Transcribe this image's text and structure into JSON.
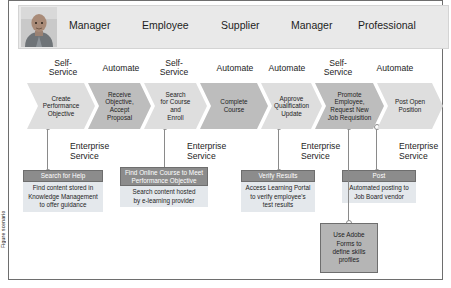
{
  "caption_strip": "Figure scenario",
  "header": {
    "avatar_name": "user-photo",
    "roles": [
      {
        "label": "Manager",
        "left": 60
      },
      {
        "label": "Employee",
        "left": 133
      },
      {
        "label": "Supplier",
        "left": 212
      },
      {
        "label": "Manager",
        "left": 282
      },
      {
        "label": "Professional",
        "left": 349
      }
    ]
  },
  "modes": [
    {
      "label": "Self-\nService",
      "left": 28,
      "top": 58,
      "width": 52
    },
    {
      "label": "Automate",
      "left": 86,
      "top": 63,
      "width": 52
    },
    {
      "label": "Self-\nService",
      "left": 139,
      "top": 58,
      "width": 52
    },
    {
      "label": "Automate",
      "left": 200,
      "top": 63,
      "width": 52
    },
    {
      "label": "Automate",
      "left": 252,
      "top": 63,
      "width": 52
    },
    {
      "label": "Self-\nService",
      "left": 303,
      "top": 58,
      "width": 52
    },
    {
      "label": "Automate",
      "left": 360,
      "top": 63,
      "width": 52
    }
  ],
  "steps": [
    {
      "label": "Create\nPerformance\nObjective",
      "left": 18,
      "width": 68,
      "shade": "light"
    },
    {
      "label": "Receive\nObjective,\nAccept\nProposal",
      "left": 79,
      "width": 63,
      "shade": "dark"
    },
    {
      "label": "Search\nfor Course\nand\nEnroll",
      "left": 135,
      "width": 63,
      "shade": "light"
    },
    {
      "label": "Complete\nCourse",
      "left": 191,
      "width": 68,
      "shade": "dark"
    },
    {
      "label": "Approve\nQualification\nUpdate",
      "left": 252,
      "width": 61,
      "shade": "light"
    },
    {
      "label": "Promote\nEmployee,\nRequest New\nJob Requisition",
      "left": 306,
      "width": 69,
      "shade": "dark"
    },
    {
      "label": "Post Open\nPosition",
      "left": 368,
      "width": 66,
      "shade": "light"
    }
  ],
  "services": [
    {
      "es_label": "Enterprise\nService",
      "es_left": 61,
      "es_top": 141,
      "dot_x": 38,
      "line_top": 126,
      "line_bottom": 171,
      "title": "Search for Help",
      "title_left": 14,
      "title_top": 169,
      "title_width": 80,
      "title_height": 12,
      "body": "Find content stored in\nKnowledge Management\nto offer guidance",
      "body_left": 14,
      "body_top": 181,
      "body_width": 80,
      "body_height": 30
    },
    {
      "es_label": "Enterprise\nService",
      "es_left": 178,
      "es_top": 141,
      "dot_x": 155,
      "line_top": 126,
      "line_bottom": 171,
      "title": "Find Online Course to Meet\nPerformance Objective",
      "title_left": 111,
      "title_top": 166,
      "title_width": 88,
      "title_height": 19,
      "body": "Search content hosted\nby e-learning provider",
      "body_left": 111,
      "body_top": 185,
      "body_width": 88,
      "body_height": 21
    },
    {
      "es_label": "Enterprise\nService",
      "es_left": 292,
      "es_top": 141,
      "dot_x": 269,
      "line_top": 126,
      "line_bottom": 171,
      "title": "Verify Results",
      "title_left": 232,
      "title_top": 169,
      "title_width": 74,
      "title_height": 12,
      "body": "Access Learning Portal\nto verify employee's\ntest results",
      "body_left": 232,
      "body_top": 181,
      "body_width": 74,
      "body_height": 30
    },
    {
      "es_label": "Enterprise\nService",
      "es_left": 390,
      "es_top": 141,
      "dot_x": 367,
      "line_top": 126,
      "line_bottom": 171,
      "title": "Post",
      "title_left": 333,
      "title_top": 169,
      "title_width": 74,
      "title_height": 12,
      "body": "Automated posting to\nJob Board vendor",
      "body_left": 333,
      "body_top": 181,
      "body_width": 74,
      "body_height": 21
    }
  ],
  "adobe": {
    "text": "Use Adobe\nForms to\ndefine skills\nprofiles",
    "left": 311,
    "top": 222,
    "width": 58,
    "height": 50,
    "dot_x": 339,
    "line_top": 126,
    "line_bottom": 222
  },
  "colors": {
    "band_bg": "#e9e9e9",
    "chevron_light": "#dedede",
    "chevron_dark": "#bdbdbd",
    "service_title_bg": "#8c8c8c",
    "service_body_bg": "#e4e8ec",
    "adobe_bg": "#b5b5b5",
    "frame_border": "#6e6e6e"
  }
}
